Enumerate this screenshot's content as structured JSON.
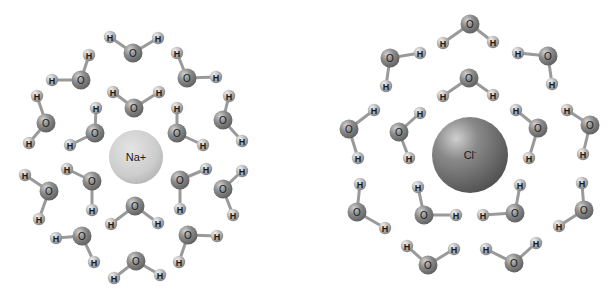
{
  "diagram": {
    "colors": {
      "oxygen": "#8a8a8a",
      "hydrogen": "#b4b4b4",
      "bond": "#9a9a9a",
      "sodium": "#cfcfcf",
      "chloride": "#7d7d7d",
      "background": "#ffffff"
    },
    "atom_labels": {
      "oxygen": "O",
      "hydrogen": "H"
    },
    "sodium": {
      "label": "Na+",
      "cx": 136,
      "cy": 157,
      "r": 27,
      "water_orientation": "oxygen toward ion",
      "waters": [
        {
          "o": [
            133,
            53
          ],
          "h": [
            [
              110,
              37
            ],
            [
              158,
              38
            ]
          ]
        },
        {
          "o": [
            81,
            80
          ],
          "h": [
            [
              89,
              55
            ],
            [
              52,
              80
            ]
          ]
        },
        {
          "o": [
            187,
            78
          ],
          "h": [
            [
              177,
              53
            ],
            [
              216,
              77
            ]
          ]
        },
        {
          "o": [
            46,
            123
          ],
          "h": [
            [
              37,
              96
            ],
            [
              29,
              143
            ]
          ]
        },
        {
          "o": [
            134,
            108
          ],
          "h": [
            [
              113,
              92
            ],
            [
              159,
              92
            ]
          ]
        },
        {
          "o": [
            95,
            133
          ],
          "h": [
            [
              96,
              108
            ],
            [
              70,
              145
            ]
          ]
        },
        {
          "o": [
            177,
            133
          ],
          "h": [
            [
              177,
              108
            ],
            [
              203,
              145
            ]
          ]
        },
        {
          "o": [
            223,
            120
          ],
          "h": [
            [
              229,
              96
            ],
            [
              242,
              141
            ]
          ]
        },
        {
          "o": [
            49,
            191
          ],
          "h": [
            [
              25,
              175
            ],
            [
              39,
              219
            ]
          ]
        },
        {
          "o": [
            92,
            181
          ],
          "h": [
            [
              67,
              169
            ],
            [
              92,
              210
            ]
          ]
        },
        {
          "o": [
            180,
            180
          ],
          "h": [
            [
              206,
              169
            ],
            [
              180,
              209
            ]
          ]
        },
        {
          "o": [
            223,
            189
          ],
          "h": [
            [
              242,
              171
            ],
            [
              233,
              215
            ]
          ]
        },
        {
          "o": [
            135,
            206
          ],
          "h": [
            [
              111,
              224
            ],
            [
              158,
              223
            ]
          ]
        },
        {
          "o": [
            82,
            236
          ],
          "h": [
            [
              56,
              238
            ],
            [
              94,
              262
            ]
          ]
        },
        {
          "o": [
            188,
            235
          ],
          "h": [
            [
              217,
              236
            ],
            [
              179,
              262
            ]
          ]
        },
        {
          "o": [
            136,
            261
          ],
          "h": [
            [
              114,
              278
            ],
            [
              160,
              275
            ]
          ]
        }
      ]
    },
    "chloride": {
      "label": "Cl-",
      "label_base": "Cl",
      "label_sup": "-",
      "cx": 470,
      "cy": 155,
      "r": 38,
      "water_orientation": "hydrogen toward ion",
      "waters": [
        {
          "o": [
            470,
            24
          ],
          "h": [
            [
              443,
              43
            ],
            [
              493,
              42
            ]
          ]
        },
        {
          "o": [
            390,
            58
          ],
          "h": [
            [
              420,
              53
            ],
            [
              386,
              86
            ]
          ]
        },
        {
          "o": [
            548,
            56
          ],
          "h": [
            [
              518,
              53
            ],
            [
              552,
              84
            ]
          ]
        },
        {
          "o": [
            469,
            78
          ],
          "h": [
            [
              443,
              96
            ],
            [
              493,
              95
            ]
          ]
        },
        {
          "o": [
            349,
            129
          ],
          "h": [
            [
              374,
              110
            ],
            [
              358,
              158
            ]
          ]
        },
        {
          "o": [
            399,
            132
          ],
          "h": [
            [
              420,
              113
            ],
            [
              409,
              158
            ]
          ]
        },
        {
          "o": [
            538,
            128
          ],
          "h": [
            [
              516,
              110
            ],
            [
              529,
              158
            ]
          ]
        },
        {
          "o": [
            590,
            125
          ],
          "h": [
            [
              567,
              110
            ],
            [
              583,
              154
            ]
          ]
        },
        {
          "o": [
            357,
            212
          ],
          "h": [
            [
              360,
              184
            ],
            [
              385,
              228
            ]
          ]
        },
        {
          "o": [
            424,
            215
          ],
          "h": [
            [
              418,
              187
            ],
            [
              456,
              215
            ]
          ]
        },
        {
          "o": [
            515,
            213
          ],
          "h": [
            [
              520,
              185
            ],
            [
              483,
              215
            ]
          ]
        },
        {
          "o": [
            584,
            210
          ],
          "h": [
            [
              582,
              183
            ],
            [
              559,
              226
            ]
          ]
        },
        {
          "o": [
            428,
            265
          ],
          "h": [
            [
              407,
              246
            ],
            [
              454,
              249
            ]
          ]
        },
        {
          "o": [
            514,
            263
          ],
          "h": [
            [
              486,
              249
            ],
            [
              536,
              243
            ]
          ]
        }
      ]
    }
  }
}
